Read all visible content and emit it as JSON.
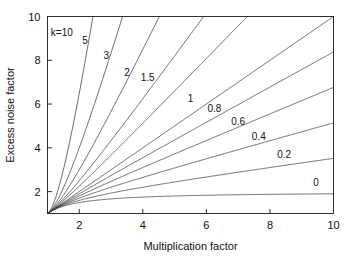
{
  "chart_data": {
    "type": "line",
    "title": "",
    "xlabel": "Multiplication factor",
    "ylabel": "Excess noise factor",
    "xlim": [
      1,
      10
    ],
    "ylim": [
      1,
      10
    ],
    "xticks": [
      2,
      4,
      6,
      8,
      10
    ],
    "yticks": [
      2,
      4,
      6,
      8,
      10
    ],
    "xticklabels": [
      "2",
      "4",
      "6",
      "8",
      "10"
    ],
    "yticklabels": [
      "2",
      "4",
      "6",
      "8",
      "10"
    ],
    "grid": false,
    "legend_position": "inline-curve-labels",
    "formula": "F = kM + (1-k)(2 - 1/M)",
    "series": [
      {
        "name": "k=10",
        "k": 10,
        "label": "k=10",
        "label_x": 1.45,
        "label_y": 9.1,
        "x": [
          1,
          1.2,
          1.4,
          1.6,
          1.8,
          2,
          2.2
        ],
        "y": [
          1,
          3.7,
          6.43,
          9.18,
          11.9,
          14.5,
          17.2
        ]
      },
      {
        "name": "5",
        "k": 5,
        "label": "5",
        "label_x": 2.18,
        "label_y": 8.75,
        "x": [
          1,
          1.4,
          1.8,
          2.2,
          2.6,
          3,
          3.4
        ],
        "y": [
          1,
          3.86,
          6.78,
          9.7,
          12.6,
          15.5,
          18.4
        ]
      },
      {
        "name": "3",
        "k": 3,
        "label": "3",
        "label_x": 2.85,
        "label_y": 8.05,
        "x": [
          1,
          1.5,
          2,
          2.5,
          3,
          3.5,
          4,
          4.5
        ],
        "y": [
          1,
          3.83,
          6.0,
          8.3,
          10.3,
          12.9,
          15.0,
          17.1
        ]
      },
      {
        "name": "2",
        "k": 2,
        "label": "2",
        "label_x": 3.5,
        "label_y": 7.3,
        "x": [
          1,
          2,
          3,
          4,
          5,
          6,
          7
        ],
        "y": [
          1,
          3.5,
          5.67,
          7.75,
          9.8,
          11.83,
          13.86
        ]
      },
      {
        "name": "1.5",
        "k": 1.5,
        "label": "1.5",
        "label_x": 4.15,
        "label_y": 7.05,
        "x": [
          1,
          2,
          3,
          4,
          5,
          6,
          7,
          8
        ],
        "y": [
          1,
          2.75,
          4.33,
          5.88,
          7.4,
          8.92,
          10.43,
          11.94
        ]
      },
      {
        "name": "1",
        "k": 1,
        "label": "1",
        "label_x": 5.5,
        "label_y": 6.1,
        "x": [
          1,
          2,
          3,
          4,
          5,
          6,
          7,
          8,
          9,
          10
        ],
        "y": [
          1,
          2,
          3,
          4,
          5,
          6,
          7,
          8,
          9,
          10
        ]
      },
      {
        "name": "0.8",
        "k": 0.8,
        "label": "0.8",
        "label_x": 6.25,
        "label_y": 5.65,
        "x": [
          1,
          2,
          3,
          4,
          5,
          6,
          7,
          8,
          9,
          10
        ],
        "y": [
          1,
          1.9,
          2.8,
          3.7,
          4.6,
          5.5,
          6.4,
          7.3,
          8.2,
          9.1
        ]
      },
      {
        "name": "0.6",
        "k": 0.6,
        "label": "0.6",
        "label_x": 7.0,
        "label_y": 5.05,
        "x": [
          1,
          2,
          3,
          4,
          5,
          6,
          7,
          8,
          9,
          10
        ],
        "y": [
          1,
          1.8,
          2.6,
          3.4,
          4.2,
          5.0,
          5.8,
          6.6,
          7.4,
          8.2
        ]
      },
      {
        "name": "0.4",
        "k": 0.4,
        "label": "0.4",
        "label_x": 7.65,
        "label_y": 4.35,
        "x": [
          1,
          2,
          3,
          4,
          5,
          6,
          7,
          8,
          9,
          10
        ],
        "y": [
          1,
          1.7,
          2.4,
          3.1,
          3.8,
          4.5,
          5.2,
          5.9,
          6.6,
          7.3
        ]
      },
      {
        "name": "0.2",
        "k": 0.2,
        "label": "0.2",
        "label_x": 8.45,
        "label_y": 3.55,
        "x": [
          1,
          2,
          3,
          4,
          5,
          6,
          7,
          8,
          9,
          10
        ],
        "y": [
          1,
          1.6,
          2.2,
          2.8,
          3.4,
          4.0,
          4.6,
          5.2,
          5.8,
          6.4
        ]
      },
      {
        "name": "0",
        "k": 0,
        "label": "0",
        "label_x": 9.45,
        "label_y": 2.25,
        "x": [
          1,
          1.5,
          2,
          3,
          4,
          5,
          6,
          7,
          8,
          9,
          10
        ],
        "y": [
          1,
          1.333,
          1.5,
          1.667,
          1.75,
          1.8,
          1.833,
          1.857,
          1.875,
          1.889,
          1.9
        ]
      }
    ]
  },
  "colors": {
    "background": "#ffffff",
    "axis": "#1a1a1a",
    "curve": "#3a3a3a",
    "text": "#111111"
  }
}
